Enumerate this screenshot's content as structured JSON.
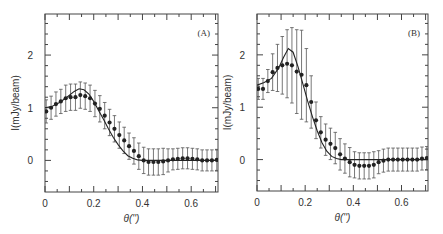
{
  "chart_data": [
    {
      "type": "scatter",
      "panel_label": "(A)",
      "xlabel": "θ('')",
      "ylabel": "I(mJy/beam)",
      "xlim": [
        0,
        0.71
      ],
      "ylim": [
        -0.6,
        2.78
      ],
      "xticks": [
        0,
        0.2,
        0.4,
        0.6
      ],
      "xtick_labels": [
        "0",
        "0.2",
        "0.4",
        "0.6"
      ],
      "yticks": [
        0,
        1,
        2
      ],
      "ytick_labels": [
        "0",
        "1",
        "2"
      ],
      "grid": false,
      "series": [
        {
          "name": "data",
          "style": "points_with_errorbars",
          "x": [
            0.005,
            0.025,
            0.045,
            0.065,
            0.085,
            0.105,
            0.125,
            0.145,
            0.165,
            0.185,
            0.205,
            0.225,
            0.245,
            0.265,
            0.285,
            0.305,
            0.325,
            0.345,
            0.365,
            0.385,
            0.405,
            0.425,
            0.445,
            0.465,
            0.485,
            0.505,
            0.525,
            0.545,
            0.565,
            0.585,
            0.605,
            0.625,
            0.645,
            0.665,
            0.685,
            0.705
          ],
          "y": [
            0.93,
            1.0,
            1.07,
            1.12,
            1.18,
            1.2,
            1.2,
            1.24,
            1.22,
            1.18,
            1.08,
            0.98,
            0.85,
            0.72,
            0.6,
            0.48,
            0.38,
            0.27,
            0.18,
            0.08,
            0.0,
            -0.03,
            -0.03,
            -0.03,
            -0.02,
            0.0,
            0.02,
            0.03,
            0.04,
            0.04,
            0.03,
            0.02,
            0.0,
            0.0,
            0.0,
            0.01
          ],
          "yerr": [
            0.22,
            0.22,
            0.23,
            0.23,
            0.25,
            0.25,
            0.25,
            0.25,
            0.25,
            0.25,
            0.25,
            0.25,
            0.25,
            0.25,
            0.25,
            0.25,
            0.25,
            0.25,
            0.25,
            0.25,
            0.25,
            0.25,
            0.25,
            0.25,
            0.25,
            0.22,
            0.2,
            0.2,
            0.2,
            0.2,
            0.2,
            0.2,
            0.2,
            0.2,
            0.2,
            0.2
          ]
        },
        {
          "name": "model",
          "style": "line",
          "x": [
            0,
            0.03,
            0.06,
            0.09,
            0.12,
            0.14,
            0.16,
            0.18,
            0.2,
            0.22,
            0.24,
            0.26,
            0.28,
            0.3,
            0.32,
            0.34,
            0.36,
            0.38,
            0.4,
            0.45,
            0.5,
            0.55,
            0.6,
            0.65,
            0.71
          ],
          "y": [
            1.0,
            1.03,
            1.1,
            1.2,
            1.31,
            1.36,
            1.34,
            1.26,
            1.12,
            0.95,
            0.78,
            0.6,
            0.44,
            0.3,
            0.18,
            0.09,
            0.04,
            0.01,
            0.0,
            0.0,
            0.0,
            0.0,
            0.0,
            0.0,
            0.0
          ]
        }
      ]
    },
    {
      "type": "scatter",
      "panel_label": "(B)",
      "xlabel": "θ('')",
      "ylabel": "I(mJy/beam)",
      "xlim": [
        0,
        0.71
      ],
      "ylim": [
        -0.6,
        2.78
      ],
      "xticks": [
        0,
        0.2,
        0.4,
        0.6
      ],
      "xtick_labels": [
        "0",
        "0.2",
        "0.4",
        "0.6"
      ],
      "yticks": [
        0,
        1,
        2
      ],
      "ytick_labels": [
        "0",
        "1",
        "2"
      ],
      "grid": false,
      "series": [
        {
          "name": "data",
          "style": "points_with_errorbars",
          "x": [
            0.005,
            0.025,
            0.045,
            0.065,
            0.085,
            0.105,
            0.125,
            0.145,
            0.165,
            0.185,
            0.205,
            0.225,
            0.245,
            0.265,
            0.285,
            0.305,
            0.325,
            0.345,
            0.365,
            0.385,
            0.405,
            0.425,
            0.445,
            0.465,
            0.485,
            0.505,
            0.525,
            0.545,
            0.565,
            0.585,
            0.605,
            0.625,
            0.645,
            0.665,
            0.685,
            0.705
          ],
          "y": [
            1.35,
            1.35,
            1.5,
            1.67,
            1.75,
            1.8,
            1.83,
            1.8,
            1.68,
            1.62,
            1.42,
            1.1,
            0.75,
            0.52,
            0.38,
            0.3,
            0.22,
            0.1,
            0.02,
            -0.05,
            -0.1,
            -0.12,
            -0.12,
            -0.12,
            -0.1,
            -0.05,
            -0.02,
            0.0,
            0.0,
            0.0,
            0.0,
            0.0,
            0.0,
            0.0,
            0.02,
            0.03
          ],
          "yerr": [
            0.2,
            0.2,
            0.22,
            0.35,
            0.45,
            0.55,
            0.65,
            0.72,
            0.8,
            0.85,
            0.7,
            0.5,
            0.35,
            0.3,
            0.3,
            0.3,
            0.3,
            0.3,
            0.28,
            0.28,
            0.25,
            0.25,
            0.25,
            0.25,
            0.25,
            0.22,
            0.22,
            0.22,
            0.22,
            0.22,
            0.22,
            0.22,
            0.22,
            0.22,
            0.22,
            0.22
          ]
        },
        {
          "name": "model",
          "style": "line",
          "x": [
            0,
            0.03,
            0.06,
            0.09,
            0.11,
            0.13,
            0.15,
            0.17,
            0.19,
            0.21,
            0.23,
            0.25,
            0.27,
            0.29,
            0.31,
            0.33,
            0.35,
            0.38,
            0.42,
            0.5,
            0.6,
            0.71
          ],
          "y": [
            1.42,
            1.47,
            1.55,
            1.75,
            1.95,
            2.12,
            2.05,
            1.78,
            1.45,
            1.12,
            0.82,
            0.55,
            0.32,
            0.16,
            0.06,
            0.02,
            0.0,
            0.0,
            0.0,
            0.0,
            0.0,
            0.0
          ]
        }
      ]
    }
  ]
}
